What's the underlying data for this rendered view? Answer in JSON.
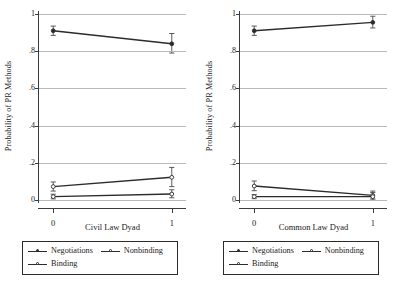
{
  "figure": {
    "ylabel": "Probability of PR Methods",
    "y_ticks": [
      "0",
      ".2",
      ".4",
      ".6",
      ".8",
      "1"
    ],
    "x_ticks": [
      "0",
      "1"
    ],
    "legend": {
      "negotiations": "Negotiations",
      "nonbinding": "Nonbinding",
      "binding": "Binding"
    }
  },
  "chart_data": [
    {
      "type": "line",
      "title": "",
      "xlabel": "Civil Law Dyad",
      "ylabel": "Probability of PR Methods",
      "x": [
        0,
        1
      ],
      "xlim": [
        -0.12,
        1.12
      ],
      "ylim": [
        0,
        1
      ],
      "xtick_labels": [
        "0",
        "1"
      ],
      "ytick_labels": [
        "0",
        ".2",
        ".4",
        ".6",
        ".8",
        "1"
      ],
      "ytick_values": [
        0,
        0.2,
        0.4,
        0.6,
        0.8,
        1
      ],
      "grid": "horizontal",
      "legend_position": "below",
      "series": [
        {
          "name": "Negotiations",
          "marker": "filled-circle",
          "values": [
            0.91,
            0.84
          ],
          "ci_low": [
            0.885,
            0.79
          ],
          "ci_high": [
            0.935,
            0.895
          ]
        },
        {
          "name": "Nonbinding",
          "marker": "open-circle",
          "values": [
            0.072,
            0.122
          ],
          "ci_low": [
            0.048,
            0.072
          ],
          "ci_high": [
            0.097,
            0.175
          ]
        },
        {
          "name": "Binding",
          "marker": "open-circle",
          "values": [
            0.018,
            0.032
          ],
          "ci_low": [
            0.006,
            0.012
          ],
          "ci_high": [
            0.031,
            0.055
          ]
        }
      ]
    },
    {
      "type": "line",
      "title": "",
      "xlabel": "Common Law Dyad",
      "ylabel": "Probability of PR Methods",
      "x": [
        0,
        1
      ],
      "xlim": [
        -0.12,
        1.12
      ],
      "ylim": [
        0,
        1
      ],
      "xtick_labels": [
        "0",
        "1"
      ],
      "ytick_labels": [
        "0",
        ".2",
        ".4",
        ".6",
        ".8",
        "1"
      ],
      "ytick_values": [
        0,
        0.2,
        0.4,
        0.6,
        0.8,
        1
      ],
      "grid": "horizontal",
      "legend_position": "below",
      "series": [
        {
          "name": "Negotiations",
          "marker": "filled-circle",
          "values": [
            0.91,
            0.955
          ],
          "ci_low": [
            0.885,
            0.925
          ],
          "ci_high": [
            0.935,
            0.988
          ]
        },
        {
          "name": "Nonbinding",
          "marker": "open-circle",
          "values": [
            0.075,
            0.025
          ],
          "ci_low": [
            0.05,
            0.006
          ],
          "ci_high": [
            0.102,
            0.048
          ]
        },
        {
          "name": "Binding",
          "marker": "open-circle",
          "values": [
            0.018,
            0.018
          ],
          "ci_low": [
            0.007,
            0.0
          ],
          "ci_high": [
            0.029,
            0.04
          ]
        }
      ]
    }
  ]
}
